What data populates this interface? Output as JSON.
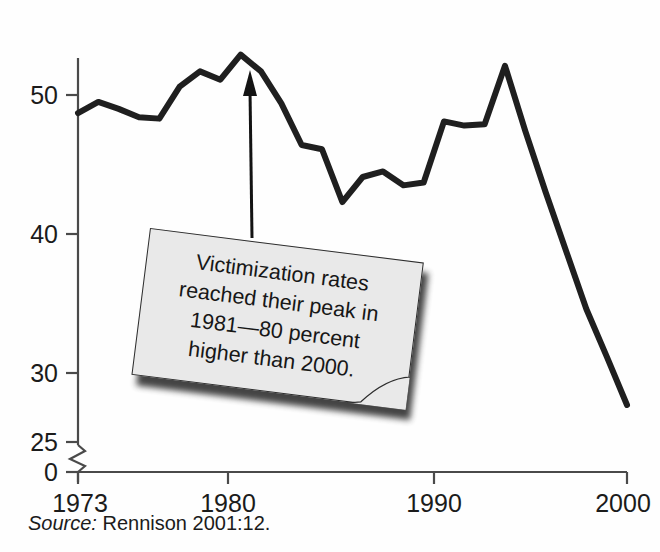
{
  "chart_data": {
    "type": "line",
    "title": "",
    "subtitle": "",
    "xlabel": "",
    "ylabel": "",
    "x": [
      1973,
      1974,
      1975,
      1976,
      1977,
      1978,
      1979,
      1980,
      1981,
      1982,
      1983,
      1984,
      1985,
      1986,
      1987,
      1988,
      1989,
      1990,
      1991,
      1992,
      1993,
      1994,
      1995,
      1996,
      1997,
      1998,
      1999,
      2000
    ],
    "series": [
      {
        "name": "Violent victimization rate",
        "values": [
          48.7,
          49.5,
          49.0,
          48.4,
          48.3,
          50.6,
          51.7,
          51.1,
          52.9,
          51.7,
          49.4,
          46.4,
          46.1,
          42.3,
          44.1,
          44.5,
          43.5,
          43.7,
          48.1,
          47.8,
          47.9,
          52.1,
          47.4,
          43.0,
          38.8,
          34.6,
          31.2,
          27.7
        ]
      }
    ],
    "xlim": [
      1973,
      2000
    ],
    "ylim": [
      25,
      55
    ],
    "grid": false,
    "legend": "none",
    "axis_break": {
      "axis": "y",
      "between": [
        0,
        25
      ],
      "style": "zigzag"
    },
    "y_ticks": [
      "50",
      "40",
      "30",
      "25",
      "0"
    ],
    "y_tick_values": [
      50,
      40,
      30,
      25,
      0
    ],
    "x_ticks": [
      "1973",
      "1980",
      "1990",
      "2000"
    ],
    "x_tick_values": [
      1973,
      1980,
      1990,
      2000
    ],
    "annotations": [
      {
        "type": "callout",
        "lines": [
          "Victimization rates",
          "reached their peak in",
          "1981—80 percent",
          "higher than 2000."
        ],
        "points_to_x": 1981,
        "points_to_y": 52.9
      }
    ]
  },
  "axis": {
    "y_labels": [
      "50",
      "40",
      "30",
      "25",
      "0"
    ],
    "x_labels": [
      "1973",
      "1980",
      "1990",
      "2000"
    ]
  },
  "callout": {
    "line1": "Victimization rates",
    "line2": "reached their peak in",
    "line3": "1981—80 percent",
    "line4": "higher than 2000."
  },
  "source": {
    "label": "Source:",
    "text": " Rennison 2001:12."
  },
  "colors": {
    "line": "#1f1f1f",
    "axis": "#4a4a4a",
    "callout_fill": "#e9e9e9",
    "callout_border": "#2d2d2d",
    "background": "#fefefe"
  }
}
